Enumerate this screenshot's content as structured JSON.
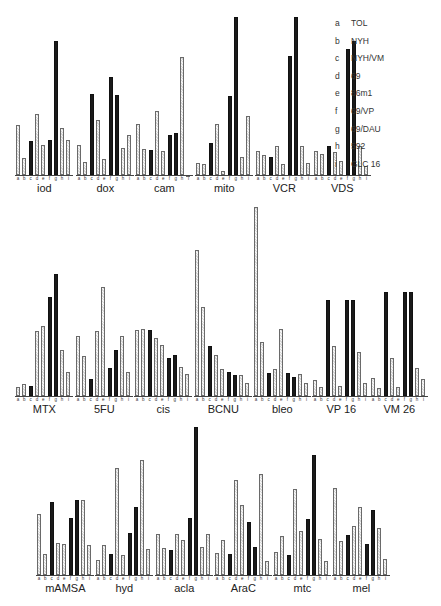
{
  "chart_data": {
    "type": "bar",
    "title": "",
    "xlabel": "",
    "ylabel": "",
    "grid": false,
    "legend_position": "top-right",
    "categories": [
      "a",
      "b",
      "c",
      "d",
      "e",
      "f",
      "g",
      "h",
      "i"
    ],
    "legend": [
      {
        "key": "a",
        "label": "TOL"
      },
      {
        "key": "b",
        "label": "NYH"
      },
      {
        "key": "c",
        "label": "NYH/VM"
      },
      {
        "key": "d",
        "label": "69"
      },
      {
        "key": "e",
        "label": "86m1"
      },
      {
        "key": "f",
        "label": "69/VP"
      },
      {
        "key": "g",
        "label": "69/DAU"
      },
      {
        "key": "h",
        "label": "592"
      },
      {
        "key": "i",
        "label": "GLC 16"
      }
    ],
    "units": "relative bar height (px above baseline)",
    "panels": [
      {
        "drug": "iod",
        "row": 0,
        "x": 16,
        "values": [
          50,
          17,
          34,
          61,
          30,
          35,
          134,
          47,
          35
        ],
        "dark": [
          false,
          false,
          true,
          false,
          false,
          true,
          true,
          false,
          false
        ]
      },
      {
        "drug": "dox",
        "row": 0,
        "x": 77,
        "values": [
          30,
          13,
          81,
          55,
          16,
          98,
          80,
          27,
          40
        ],
        "dark": [
          false,
          false,
          true,
          false,
          false,
          true,
          true,
          false,
          false
        ]
      },
      {
        "drug": "cam",
        "row": 0,
        "x": 136,
        "values": [
          51,
          26,
          25,
          64,
          24,
          40,
          42,
          118,
          0
        ],
        "dark": [
          false,
          false,
          true,
          false,
          false,
          true,
          true,
          false,
          false
        ]
      },
      {
        "drug": "mito",
        "row": 0,
        "x": 196,
        "values": [
          12,
          11,
          32,
          51,
          4,
          79,
          158,
          18,
          59
        ],
        "dark": [
          false,
          false,
          true,
          false,
          false,
          true,
          true,
          false,
          false
        ]
      },
      {
        "drug": "VCR",
        "row": 0,
        "x": 256,
        "values": [
          24,
          20,
          18,
          29,
          11,
          119,
          158,
          29,
          12
        ],
        "dark": [
          false,
          false,
          true,
          false,
          false,
          true,
          true,
          false,
          false
        ]
      },
      {
        "drug": "VDS",
        "row": 0,
        "x": 314,
        "values": [
          24,
          21,
          29,
          23,
          14,
          126,
          134,
          29,
          9
        ],
        "dark": [
          false,
          false,
          true,
          false,
          false,
          true,
          true,
          false,
          false
        ]
      },
      {
        "drug": "MTX",
        "row": 1,
        "x": 16,
        "values": [
          9,
          12,
          10,
          65,
          70,
          99,
          122,
          46,
          24
        ],
        "dark": [
          false,
          false,
          true,
          false,
          false,
          true,
          true,
          false,
          false
        ]
      },
      {
        "drug": "5FU",
        "row": 1,
        "x": 76,
        "values": [
          60,
          40,
          17,
          65,
          109,
          28,
          46,
          60,
          24
        ],
        "dark": [
          false,
          false,
          true,
          false,
          false,
          true,
          true,
          false,
          false
        ]
      },
      {
        "drug": "cis",
        "row": 1,
        "x": 135,
        "values": [
          66,
          67,
          66,
          58,
          51,
          38,
          41,
          29,
          22
        ],
        "dark": [
          false,
          false,
          true,
          false,
          false,
          true,
          true,
          false,
          false
        ]
      },
      {
        "drug": "BCNU",
        "row": 1,
        "x": 195,
        "values": [
          146,
          89,
          50,
          41,
          27,
          24,
          21,
          21,
          13
        ],
        "dark": [
          false,
          false,
          true,
          false,
          false,
          true,
          true,
          false,
          false
        ]
      },
      {
        "drug": "bleo",
        "row": 1,
        "x": 254,
        "values": [
          189,
          54,
          23,
          27,
          67,
          23,
          19,
          22,
          13
        ],
        "dark": [
          false,
          false,
          true,
          false,
          false,
          true,
          true,
          false,
          false
        ]
      },
      {
        "drug": "VP 16",
        "row": 1,
        "x": 313,
        "values": [
          16,
          9,
          96,
          50,
          10,
          96,
          96,
          44,
          13
        ],
        "dark": [
          false,
          false,
          true,
          false,
          false,
          true,
          true,
          false,
          false
        ]
      },
      {
        "drug": "VM 26",
        "row": 1,
        "x": 371,
        "values": [
          18,
          8,
          104,
          38,
          9,
          104,
          104,
          28,
          17
        ],
        "dark": [
          false,
          false,
          true,
          false,
          false,
          true,
          true,
          false,
          false
        ]
      },
      {
        "drug": "mAMSA",
        "row": 2,
        "x": 37,
        "values": [
          61,
          21,
          73,
          32,
          31,
          57,
          75,
          75,
          30
        ],
        "dark": [
          false,
          false,
          true,
          false,
          false,
          true,
          true,
          false,
          false
        ]
      },
      {
        "drug": "hyd",
        "row": 2,
        "x": 96,
        "values": [
          15,
          30,
          21,
          107,
          20,
          42,
          68,
          115,
          26
        ],
        "dark": [
          false,
          false,
          true,
          false,
          false,
          true,
          true,
          false,
          false
        ]
      },
      {
        "drug": "acla",
        "row": 2,
        "x": 156,
        "values": [
          41,
          27,
          25,
          41,
          35,
          57,
          148,
          28,
          41
        ],
        "dark": [
          false,
          false,
          true,
          false,
          false,
          true,
          true,
          false,
          false
        ]
      },
      {
        "drug": "AraC",
        "row": 2,
        "x": 215,
        "values": [
          22,
          35,
          21,
          95,
          70,
          53,
          28,
          101,
          14
        ],
        "dark": [
          false,
          false,
          true,
          false,
          false,
          true,
          true,
          false,
          false
        ]
      },
      {
        "drug": "mtc",
        "row": 2,
        "x": 274,
        "values": [
          23,
          39,
          20,
          86,
          44,
          56,
          120,
          36,
          14
        ],
        "dark": [
          false,
          false,
          true,
          false,
          false,
          true,
          true,
          false,
          false
        ]
      },
      {
        "drug": "mel",
        "row": 2,
        "x": 333,
        "values": [
          87,
          34,
          40,
          49,
          68,
          31,
          65,
          47,
          16
        ],
        "dark": [
          false,
          false,
          true,
          false,
          false,
          true,
          true,
          false,
          false
        ]
      }
    ],
    "row_baselines": [
      175,
      396,
      575
    ]
  }
}
